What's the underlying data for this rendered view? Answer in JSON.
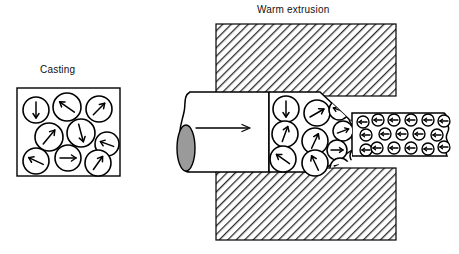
{
  "figure": {
    "title_casting": "Casting",
    "title_extrusion": "Warm extrusion"
  },
  "colors": {
    "line": "#000000",
    "hatch": "#2b2b2b",
    "billet_end_fill": "#9a9a9a",
    "background": "#ffffff"
  },
  "diagram_data": {
    "type": "process-schematic",
    "panels": [
      {
        "name": "casting",
        "label": "Casting",
        "box": {
          "x": 17,
          "y": 88,
          "w": 103,
          "h": 88
        },
        "grain_description": "randomly oriented equiaxed grains",
        "grains": [
          {
            "cx": 36,
            "cy": 110,
            "r": 13,
            "angle": 90
          },
          {
            "cx": 67,
            "cy": 107,
            "r": 14,
            "angle": 215
          },
          {
            "cx": 99,
            "cy": 109,
            "r": 13,
            "angle": 315
          },
          {
            "cx": 49,
            "cy": 137,
            "r": 14,
            "angle": 310
          },
          {
            "cx": 81,
            "cy": 133,
            "r": 14,
            "angle": 75
          },
          {
            "cx": 107,
            "cy": 144,
            "r": 12,
            "angle": 200
          },
          {
            "cx": 36,
            "cy": 161,
            "r": 13,
            "angle": 205
          },
          {
            "cx": 68,
            "cy": 158,
            "r": 13,
            "angle": 0
          },
          {
            "cx": 98,
            "cy": 163,
            "r": 13,
            "angle": 305
          }
        ]
      },
      {
        "name": "warm-extrusion",
        "label": "Warm extrusion",
        "die_blocks": [
          {
            "x": 216,
            "y": 24,
            "w": 180,
            "h": 72
          },
          {
            "x": 216,
            "y": 168,
            "w": 180,
            "h": 72
          }
        ],
        "billet": {
          "x": 178,
          "y": 92,
          "w": 120,
          "h": 80
        },
        "flow_arrow": {
          "x1": 196,
          "y1": 128,
          "x2": 250,
          "y2": 128,
          "direction": "right"
        },
        "billet_end_ellipse": {
          "cx": 186,
          "cy": 148,
          "rx": 9,
          "ry": 23
        },
        "zones": [
          {
            "name": "entry-coarse-random",
            "grain_size": "large",
            "orientation": "random"
          },
          {
            "name": "die-taper-transition",
            "grain_size": "medium",
            "orientation": "partially aligned"
          },
          {
            "name": "exit-fine-aligned",
            "grain_size": "small",
            "orientation": "aligned, arrows point left"
          }
        ],
        "entry_grains": [
          {
            "cx": 286,
            "cy": 109,
            "r": 13,
            "angle": 90
          },
          {
            "cx": 317,
            "cy": 113,
            "r": 13,
            "angle": 330
          },
          {
            "cx": 285,
            "cy": 134,
            "r": 13,
            "angle": 290
          },
          {
            "cx": 315,
            "cy": 141,
            "r": 13,
            "angle": 295
          },
          {
            "cx": 283,
            "cy": 159,
            "r": 13,
            "angle": 215
          },
          {
            "cx": 315,
            "cy": 163,
            "r": 13,
            "angle": 245
          }
        ],
        "transition_grains": [
          {
            "cx": 339,
            "cy": 110,
            "r": 10,
            "angle": 200
          },
          {
            "cx": 343,
            "cy": 131,
            "r": 10,
            "angle": 340
          },
          {
            "cx": 337,
            "cy": 150,
            "r": 10,
            "angle": 0
          },
          {
            "cx": 340,
            "cy": 168,
            "r": 10,
            "angle": 200
          },
          {
            "cx": 357,
            "cy": 118,
            "r": 8,
            "angle": 195
          },
          {
            "cx": 360,
            "cy": 137,
            "r": 8,
            "angle": 350
          },
          {
            "cx": 358,
            "cy": 156,
            "r": 8,
            "angle": 330
          },
          {
            "cx": 354,
            "cy": 170,
            "r": 8,
            "angle": 195
          }
        ],
        "exit_grains": [
          {
            "cx": 374,
            "cy": 120,
            "r": 6,
            "angle": 180
          },
          {
            "cx": 392,
            "cy": 119,
            "r": 6,
            "angle": 180
          },
          {
            "cx": 410,
            "cy": 119,
            "r": 6,
            "angle": 180
          },
          {
            "cx": 428,
            "cy": 119,
            "r": 6,
            "angle": 180
          },
          {
            "cx": 443,
            "cy": 121,
            "r": 6,
            "angle": 180
          },
          {
            "cx": 366,
            "cy": 134,
            "r": 6,
            "angle": 180
          },
          {
            "cx": 384,
            "cy": 133,
            "r": 6,
            "angle": 180
          },
          {
            "cx": 401,
            "cy": 133,
            "r": 6,
            "angle": 180
          },
          {
            "cx": 419,
            "cy": 133,
            "r": 6,
            "angle": 180
          },
          {
            "cx": 437,
            "cy": 134,
            "r": 6,
            "angle": 180
          },
          {
            "cx": 374,
            "cy": 148,
            "r": 6,
            "angle": 180
          },
          {
            "cx": 392,
            "cy": 148,
            "r": 6,
            "angle": 180
          },
          {
            "cx": 410,
            "cy": 148,
            "r": 6,
            "angle": 180
          },
          {
            "cx": 428,
            "cy": 149,
            "r": 6,
            "angle": 180
          },
          {
            "cx": 444,
            "cy": 147,
            "r": 6,
            "angle": 180
          },
          {
            "cx": 363,
            "cy": 122,
            "r": 6,
            "angle": 180
          },
          {
            "cx": 366,
            "cy": 150,
            "r": 6,
            "angle": 180
          }
        ]
      }
    ]
  }
}
